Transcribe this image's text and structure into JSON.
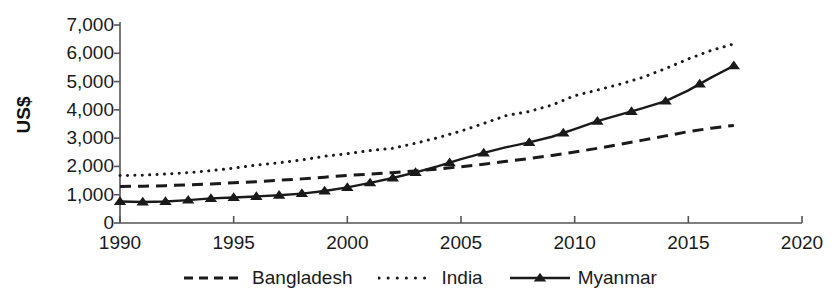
{
  "chart_data": {
    "type": "line",
    "title": "",
    "xlabel": "",
    "ylabel": "US$",
    "xlim": [
      1990,
      2020
    ],
    "ylim": [
      0,
      7000
    ],
    "grid": false,
    "legend_position": "bottom",
    "xticks": [
      1990,
      1995,
      2000,
      2005,
      2010,
      2015,
      2020
    ],
    "xtick_labels": [
      "1990",
      "1995",
      "2000",
      "2005",
      "2010",
      "2015",
      "2020"
    ],
    "yticks": [
      0,
      1000,
      2000,
      3000,
      4000,
      5000,
      6000,
      7000
    ],
    "ytick_labels": [
      "0",
      "1,000",
      "2,000",
      "3,000",
      "4,000",
      "5,000",
      "6,000",
      "7,000"
    ],
    "x": [
      1990,
      1991,
      1992,
      1993,
      1994,
      1995,
      1996,
      1997,
      1998,
      1999,
      2000,
      2001,
      2002,
      2003,
      2004,
      2005,
      2006,
      2007,
      2008,
      2009,
      2010,
      2011,
      2012,
      2013,
      2014,
      2015,
      2016,
      2017
    ],
    "series": [
      {
        "name": "Bangladesh",
        "style": "dashed",
        "color": "#1a1a1a",
        "marker": "none",
        "values": [
          1290,
          1300,
          1320,
          1350,
          1380,
          1420,
          1460,
          1510,
          1560,
          1620,
          1680,
          1730,
          1780,
          1840,
          1910,
          1990,
          2080,
          2180,
          2280,
          2390,
          2510,
          2640,
          2780,
          2930,
          3080,
          3230,
          3350,
          3450
        ]
      },
      {
        "name": "India",
        "style": "dotted",
        "color": "#1a1a1a",
        "marker": "none",
        "values": [
          1680,
          1690,
          1730,
          1780,
          1850,
          1940,
          2050,
          2130,
          2230,
          2360,
          2450,
          2560,
          2640,
          2820,
          3020,
          3250,
          3520,
          3800,
          3940,
          4170,
          4500,
          4700,
          4910,
          5150,
          5460,
          5800,
          6100,
          6330
        ]
      },
      {
        "name": "Myanmar",
        "style": "solid",
        "color": "#1a1a1a",
        "marker": "triangle",
        "values": [
          760,
          740,
          760,
          810,
          870,
          900,
          940,
          980,
          1040,
          1130,
          1260,
          1420,
          1590,
          1790,
          2010,
          2260,
          2480,
          2680,
          2850,
          3050,
          3320,
          3600,
          3830,
          4060,
          4310,
          4690,
          5140,
          5560
        ]
      }
    ],
    "marker_years": [
      1990,
      1991,
      1992,
      1993,
      1994,
      1995,
      1996,
      1997,
      1998,
      1999,
      2000,
      2001,
      2002,
      2003,
      2004.5,
      2006,
      2008,
      2009.5,
      2011,
      2012.5,
      2014,
      2015.5,
      2017
    ]
  },
  "legend": {
    "items": [
      {
        "label": "Bangladesh",
        "style": "dashed",
        "marker": "none"
      },
      {
        "label": "India",
        "style": "dotted",
        "marker": "none"
      },
      {
        "label": "Myanmar",
        "style": "solid",
        "marker": "triangle"
      }
    ]
  },
  "axis": {
    "line_color": "#555555"
  }
}
